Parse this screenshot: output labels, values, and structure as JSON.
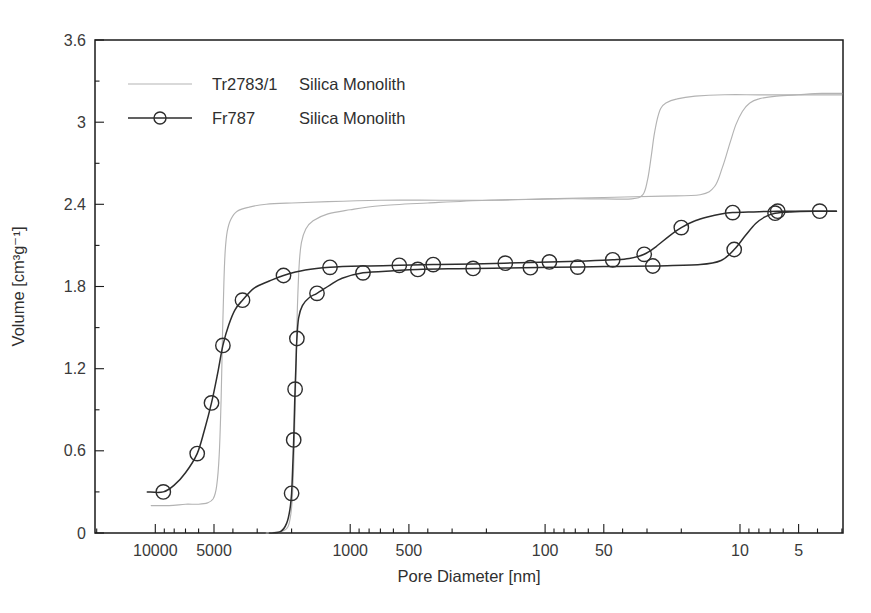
{
  "figure": {
    "background": "#ffffff"
  },
  "chart_data": {
    "type": "line",
    "title": "",
    "xlabel": "Pore Diameter [nm]",
    "ylabel": "Volume [cm³g⁻¹]",
    "x_scale": "log-reversed",
    "x_range": [
      20400,
      2.96
    ],
    "ylim": [
      0,
      3.6
    ],
    "x_major_ticks": [
      10000,
      5000,
      1000,
      500,
      100,
      50,
      10,
      5
    ],
    "y_major_ticks": [
      0,
      0.6,
      1.2,
      1.8,
      2.4,
      3,
      3.6
    ],
    "y_tick_labels": [
      "0",
      "0.6",
      "1.2",
      "1.8",
      "2.4",
      "3",
      "3.6"
    ],
    "y_minor_ticks": [
      0.3,
      0.9,
      1.5,
      2.1,
      2.7,
      3.3
    ],
    "grid": false,
    "colors": {
      "frame": "#1a1a1a",
      "text": "#3a3a3a",
      "gray_series": "#b3b3b3",
      "black_series": "#2d2d2d"
    },
    "legend": {
      "position": "upper-left-inside",
      "entries": [
        {
          "name": "Tr2783/1",
          "material": "Silica Monolith"
        },
        {
          "name": "Fr787",
          "material": "Silica Monolith"
        }
      ]
    },
    "series": [
      {
        "id": "tr2783-1",
        "label": "Tr2783/1 Silica Monolith",
        "color": "#b3b3b3",
        "marker": "none",
        "line_width": 1.15,
        "branches": {
          "intrusion": [
            [
              2700,
              0
            ],
            [
              2300,
              0.01
            ],
            [
              2080,
              0.05
            ],
            [
              1990,
              0.22
            ],
            [
              1940,
              0.6
            ],
            [
              1905,
              1.1
            ],
            [
              1870,
              1.6
            ],
            [
              1830,
              1.95
            ],
            [
              1780,
              2.12
            ],
            [
              1690,
              2.22
            ],
            [
              1550,
              2.28
            ],
            [
              1300,
              2.33
            ],
            [
              1000,
              2.36
            ],
            [
              700,
              2.39
            ],
            [
              400,
              2.41
            ],
            [
              200,
              2.43
            ],
            [
              100,
              2.44
            ],
            [
              50,
              2.45
            ],
            [
              25,
              2.46
            ],
            [
              16,
              2.47
            ],
            [
              13.5,
              2.53
            ],
            [
              12.3,
              2.67
            ],
            [
              11.3,
              2.84
            ],
            [
              10.5,
              2.98
            ],
            [
              9.7,
              3.08
            ],
            [
              8.9,
              3.14
            ],
            [
              8,
              3.17
            ],
            [
              6.5,
              3.19
            ],
            [
              5,
              3.2
            ],
            [
              3.8,
              3.21
            ],
            [
              3,
              3.21
            ]
          ],
          "extrusion": [
            [
              10500,
              0.2
            ],
            [
              8500,
              0.2
            ],
            [
              7000,
              0.21
            ],
            [
              6000,
              0.21
            ],
            [
              5400,
              0.22
            ],
            [
              5050,
              0.25
            ],
            [
              4850,
              0.34
            ],
            [
              4700,
              0.57
            ],
            [
              4600,
              0.97
            ],
            [
              4520,
              1.45
            ],
            [
              4450,
              1.83
            ],
            [
              4380,
              2.06
            ],
            [
              4280,
              2.2
            ],
            [
              4100,
              2.29
            ],
            [
              3800,
              2.35
            ],
            [
              3300,
              2.38
            ],
            [
              2700,
              2.4
            ],
            [
              2000,
              2.41
            ],
            [
              1300,
              2.42
            ],
            [
              700,
              2.43
            ],
            [
              350,
              2.43
            ],
            [
              180,
              2.43
            ],
            [
              90,
              2.44
            ],
            [
              50,
              2.44
            ],
            [
              36,
              2.44
            ],
            [
              31.5,
              2.47
            ],
            [
              29.8,
              2.58
            ],
            [
              28.6,
              2.74
            ],
            [
              27.6,
              2.9
            ],
            [
              26.6,
              3.02
            ],
            [
              25.5,
              3.1
            ],
            [
              24,
              3.14
            ],
            [
              21,
              3.17
            ],
            [
              17,
              3.19
            ],
            [
              12,
              3.2
            ],
            [
              8,
              3.2
            ],
            [
              5,
              3.2
            ],
            [
              3,
              3.2
            ]
          ]
        }
      },
      {
        "id": "fr787",
        "label": "Fr787 Silica Monolith",
        "color": "#2d2d2d",
        "marker": "circle",
        "line_width": 1.5,
        "branches": {
          "intrusion": [
            [
              2600,
              0
            ],
            [
              2280,
              0.01
            ],
            [
              2120,
              0.07
            ],
            [
              2040,
              0.17
            ],
            [
              2000,
              0.29
            ],
            [
              1972,
              0.48
            ],
            [
              1950,
              0.68
            ],
            [
              1934,
              0.87
            ],
            [
              1918,
              1.05
            ],
            [
              1898,
              1.24
            ],
            [
              1878,
              1.42
            ],
            [
              1840,
              1.57
            ],
            [
              1760,
              1.66
            ],
            [
              1620,
              1.72
            ],
            [
              1480,
              1.75
            ],
            [
              1270,
              1.81
            ],
            [
              1100,
              1.86
            ],
            [
              860,
              1.9
            ],
            [
              600,
              1.915
            ],
            [
              450,
              1.925
            ],
            [
              280,
              1.93
            ],
            [
              160,
              1.935
            ],
            [
              90,
              1.94
            ],
            [
              50,
              1.945
            ],
            [
              28,
              1.95
            ],
            [
              16,
              1.96
            ],
            [
              12.5,
              1.99
            ],
            [
              10.7,
              2.07
            ],
            [
              9.4,
              2.17
            ],
            [
              8.3,
              2.26
            ],
            [
              7.4,
              2.31
            ],
            [
              6.6,
              2.335
            ],
            [
              5.5,
              2.345
            ],
            [
              4.2,
              2.35
            ],
            [
              3.2,
              2.35
            ]
          ],
          "extrusion": [
            [
              11000,
              0.3
            ],
            [
              9100,
              0.3
            ],
            [
              8000,
              0.35
            ],
            [
              7000,
              0.44
            ],
            [
              6100,
              0.58
            ],
            [
              5600,
              0.75
            ],
            [
              5150,
              0.95
            ],
            [
              4800,
              1.16
            ],
            [
              4500,
              1.37
            ],
            [
              4200,
              1.52
            ],
            [
              3900,
              1.63
            ],
            [
              3570,
              1.7
            ],
            [
              3100,
              1.79
            ],
            [
              2600,
              1.84
            ],
            [
              2200,
              1.88
            ],
            [
              1700,
              1.92
            ],
            [
              1270,
              1.94
            ],
            [
              840,
              1.95
            ],
            [
              560,
              1.955
            ],
            [
              375,
              1.96
            ],
            [
              234,
              1.965
            ],
            [
              119,
              1.975
            ],
            [
              68,
              1.985
            ],
            [
              45,
              1.995
            ],
            [
              37,
              2.005
            ],
            [
              31,
              2.035
            ],
            [
              27,
              2.09
            ],
            [
              23,
              2.17
            ],
            [
              20,
              2.23
            ],
            [
              17,
              2.28
            ],
            [
              14.5,
              2.31
            ],
            [
              12.5,
              2.33
            ],
            [
              10.9,
              2.34
            ],
            [
              8.5,
              2.345
            ],
            [
              6.4,
              2.35
            ],
            [
              4.5,
              2.35
            ],
            [
              3.2,
              2.35
            ]
          ]
        },
        "markers": {
          "intrusion": [
            [
              2000,
              0.29
            ],
            [
              1950,
              0.68
            ],
            [
              1918,
              1.05
            ],
            [
              1878,
              1.42
            ],
            [
              1480,
              1.75
            ],
            [
              860,
              1.9
            ],
            [
              450,
              1.925
            ],
            [
              234,
              1.932
            ],
            [
              119,
              1.937
            ],
            [
              68,
              1.942
            ],
            [
              28,
              1.95
            ],
            [
              10.7,
              2.07
            ],
            [
              6.6,
              2.335
            ]
          ],
          "extrusion": [
            [
              9100,
              0.3
            ],
            [
              6100,
              0.58
            ],
            [
              5150,
              0.95
            ],
            [
              4500,
              1.37
            ],
            [
              3570,
              1.7
            ],
            [
              2200,
              1.88
            ],
            [
              1270,
              1.94
            ],
            [
              560,
              1.955
            ],
            [
              375,
              1.96
            ],
            [
              160,
              1.97
            ],
            [
              95,
              1.98
            ],
            [
              45,
              1.995
            ],
            [
              31,
              2.035
            ],
            [
              20,
              2.23
            ],
            [
              10.9,
              2.34
            ],
            [
              6.4,
              2.35
            ],
            [
              3.9,
              2.35
            ]
          ]
        }
      }
    ]
  }
}
